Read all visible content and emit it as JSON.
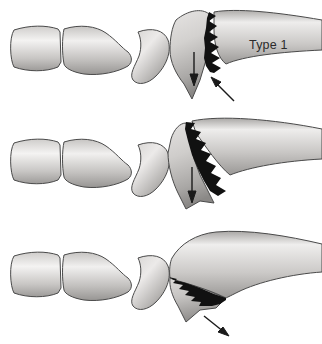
{
  "figure": {
    "background_color": "#ffffff",
    "bone_fill_light": "#f2f1f0",
    "bone_fill_mid": "#b9b7b5",
    "bone_fill_dark": "#8b8987",
    "bone_outline_color": "#3a3a3a",
    "fracture_color": "#111111",
    "arrow_color": "#1a1a1a",
    "label_color": "#2b2b2b"
  },
  "panels": [
    {
      "id": "type-1",
      "label": "Type 1",
      "fracture_description": "wide jagged vertical fracture, fully displaced",
      "arrow_count": 2,
      "arrows": [
        "down-arrow",
        "up-right-arrow"
      ]
    },
    {
      "id": "type-2",
      "label": "Type 2",
      "fracture_description": "wide oblique jagged fracture with separated fragment",
      "arrow_count": 1,
      "arrows": [
        "down-arrow"
      ]
    },
    {
      "id": "type-3",
      "label": "Type 3",
      "fracture_description": "thin oblique jagged fracture, minimally displaced",
      "arrow_count": 1,
      "arrows": [
        "down-right-arrow"
      ]
    }
  ],
  "bones": {
    "distal_phalanx": "distal-phalanx",
    "middle_phalanx": "middle-phalanx",
    "sesamoid": "crescent-sesamoid-bone",
    "proximal_fragment": "proximal-phalanx-base-fragment",
    "metatarsal_shaft": "metatarsal-shaft"
  }
}
